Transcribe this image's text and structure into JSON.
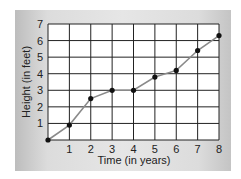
{
  "chart_data": {
    "type": "line",
    "title": "",
    "xlabel": "Time (in years)",
    "ylabel": "Height (in feet)",
    "x": [
      0,
      1,
      2,
      3,
      4,
      5,
      6,
      7,
      8
    ],
    "series": [
      {
        "name": "Height",
        "values": [
          0,
          0.9,
          2.5,
          3,
          3,
          3.8,
          4.2,
          5.4,
          6.3
        ]
      }
    ],
    "x_ticks": [
      "1",
      "2",
      "3",
      "4",
      "5",
      "6",
      "7",
      "8"
    ],
    "y_ticks": [
      "1",
      "2",
      "3",
      "4",
      "5",
      "6",
      "7"
    ],
    "xlim": [
      0,
      8
    ],
    "ylim": [
      0,
      7
    ],
    "grid": true,
    "legend": "none",
    "colors": {
      "line": "#8a8a8a",
      "point": "#111111",
      "grid": "#222222",
      "plot_bg": "#ffffff"
    }
  }
}
